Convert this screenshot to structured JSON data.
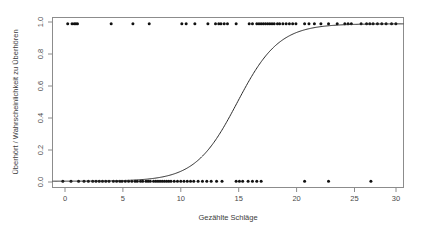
{
  "chart_data": {
    "type": "scatter",
    "title": "",
    "xlabel": "Gezählte Schläge",
    "ylabel": "Überhört / Wahrscheinlichkeit zu Überhören",
    "xlim": [
      -0.8,
      31.5
    ],
    "ylim": [
      -0.04,
      1.04
    ],
    "grid": false,
    "legend": null,
    "xticks": [
      0,
      5,
      10,
      15,
      20,
      25,
      30
    ],
    "xticklabels": [
      "0",
      "5",
      "10",
      "15",
      "20",
      "25",
      "30"
    ],
    "yticks": [
      0.0,
      0.2,
      0.4,
      0.6,
      0.8,
      1.0
    ],
    "yticklabels": [
      "0.0",
      "0.2",
      "0.4",
      "0.6",
      "0.8",
      "1.0"
    ],
    "series": [
      {
        "name": "Beobachtungen (überhört = 1 / nicht überhört = 0)",
        "type": "scatter",
        "marker": "filled-circle",
        "x": [
          0.6,
          1.0,
          1.2,
          1.35,
          1.5,
          4.6,
          6.6,
          8.1,
          11.1,
          11.5,
          12.3,
          13.5,
          14.2,
          14.5,
          14.7,
          15.0,
          15.3,
          16.1,
          17.3,
          17.6,
          18.0,
          18.2,
          18.4,
          18.6,
          18.8,
          19.0,
          19.2,
          19.4,
          19.6,
          19.9,
          20.1,
          20.4,
          20.7,
          21.0,
          21.3,
          21.6,
          22.4,
          22.8,
          23.3,
          23.9,
          24.6,
          25.4,
          26.1,
          26.4,
          26.7,
          27.6,
          28.1,
          28.4,
          28.7,
          29.1,
          29.5,
          29.9,
          30.4,
          30.8
        ],
        "y": [
          1,
          1,
          1,
          1,
          1,
          1,
          1,
          1,
          1,
          1,
          1,
          1,
          1,
          1,
          1,
          1,
          1,
          1,
          1,
          1,
          1,
          1,
          1,
          1,
          1,
          1,
          1,
          1,
          1,
          1,
          1,
          1,
          1,
          1,
          1,
          1,
          1,
          1,
          1,
          1,
          1,
          1,
          1,
          1,
          1,
          1,
          1,
          1,
          1,
          1,
          1,
          1,
          1,
          1
        ]
      },
      {
        "name": "Beobachtungen (nicht überhört)",
        "type": "scatter",
        "marker": "filled-circle",
        "x": [
          0.15,
          0.9,
          1.6,
          2.1,
          2.5,
          2.9,
          3.2,
          3.5,
          3.8,
          4.1,
          4.4,
          4.8,
          5.1,
          5.4,
          5.6,
          5.9,
          6.2,
          6.5,
          6.8,
          7.0,
          7.3,
          7.5,
          7.8,
          8.0,
          8.2,
          8.5,
          8.7,
          8.9,
          9.1,
          9.3,
          9.5,
          9.7,
          9.9,
          10.1,
          10.4,
          10.7,
          11.0,
          11.3,
          11.6,
          11.9,
          12.2,
          12.6,
          13.0,
          13.4,
          13.8,
          14.3,
          14.8,
          16.1,
          16.4,
          16.7,
          17.2,
          17.6,
          18.0,
          18.4,
          22.4,
          24.6,
          28.5
        ],
        "y": [
          0,
          0,
          0,
          0,
          0,
          0,
          0,
          0,
          0,
          0,
          0,
          0,
          0,
          0,
          0,
          0,
          0,
          0,
          0,
          0,
          0,
          0,
          0,
          0,
          0,
          0,
          0,
          0,
          0,
          0,
          0,
          0,
          0,
          0,
          0,
          0,
          0,
          0,
          0,
          0,
          0,
          0,
          0,
          0,
          0,
          0,
          0,
          0,
          0,
          0,
          0,
          0,
          0,
          0,
          0,
          0,
          0
        ]
      },
      {
        "name": "Logistische Regressionskurve",
        "type": "line",
        "model": "logistic",
        "midpoint_x0": 16.2,
        "slope_k": 0.52,
        "x": [
          0,
          2,
          4,
          6,
          8,
          9,
          10,
          11,
          12,
          13,
          14,
          15,
          16,
          16.2,
          17,
          18,
          19,
          20,
          21,
          22,
          24,
          26,
          28,
          30,
          31
        ],
        "y": [
          0.0002,
          0.0006,
          0.0017,
          0.0047,
          0.0131,
          0.0218,
          0.0362,
          0.0595,
          0.0963,
          0.1518,
          0.2313,
          0.3358,
          0.4556,
          0.5,
          0.5793,
          0.6923,
          0.7857,
          0.8563,
          0.9058,
          0.9391,
          0.9761,
          0.9913,
          0.9969,
          0.9989,
          0.9993
        ]
      }
    ]
  },
  "axes": {
    "x_title": "Gezählte Schläge",
    "y_title": "Überhört / Wahrscheinlichkeit zu Überhören"
  },
  "style": {
    "background": "#ffffff",
    "frame_color": "#8c8c8c",
    "point_color": "#111111",
    "curve_color": "#2b2b2b",
    "text_color": "#3c3c3c"
  }
}
